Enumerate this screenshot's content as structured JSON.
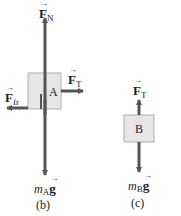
{
  "colors": {
    "arrow": "#555555",
    "box_fill": "#e6e6e6",
    "box_stroke": "#b0b0b0",
    "text": "#222222"
  },
  "diagram_b": {
    "caption": "(b)",
    "box_label": "A",
    "forces": {
      "normal": {
        "symbol": "F",
        "arrow": "→",
        "subscript": "N"
      },
      "tension": {
        "symbol": "F",
        "arrow": "→",
        "subscript": "T"
      },
      "friction": {
        "symbol": "F",
        "arrow": "→",
        "subscript": "fr"
      },
      "weight": {
        "mass": "m",
        "mass_sub": "A",
        "g": "g",
        "arrow": "→"
      }
    }
  },
  "diagram_c": {
    "caption": "(c)",
    "box_label": "B",
    "forces": {
      "tension": {
        "symbol": "F",
        "arrow": "→",
        "subscript": "T"
      },
      "weight": {
        "mass": "m",
        "mass_sub": "B",
        "g": "g",
        "arrow": "→"
      }
    }
  }
}
